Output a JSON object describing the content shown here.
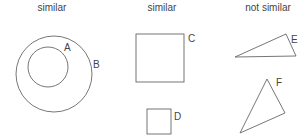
{
  "headings": {
    "col1": "similar",
    "col2": "similar",
    "col3": "not similar"
  },
  "shapes": {
    "A": "A",
    "B": "B",
    "C": "C",
    "D": "D",
    "E": "E",
    "F": "F"
  },
  "colors": {
    "stroke": "#555555",
    "text": "#444444"
  }
}
